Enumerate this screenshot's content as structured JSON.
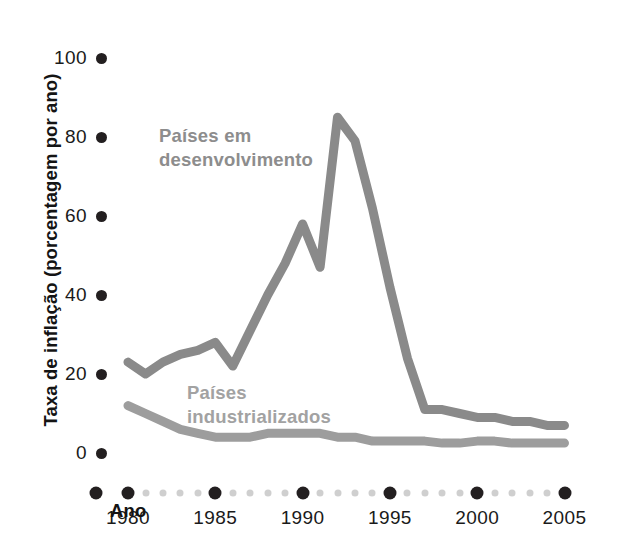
{
  "chart_data": {
    "type": "line",
    "title": "",
    "xlabel": "Ano",
    "ylabel": "Taxa de inflação (porcentagem por ano)",
    "xlim": [
      1979,
      2005
    ],
    "ylim": [
      0,
      100
    ],
    "yticks": [
      0,
      20,
      40,
      60,
      80,
      100
    ],
    "xticks": [
      1980,
      1985,
      1990,
      1995,
      2000,
      2005
    ],
    "xticklabels": [
      "1980",
      "1985",
      "1990",
      "1995",
      "2000",
      "2005"
    ],
    "yticklabels": [
      "0",
      "20",
      "40",
      "60",
      "80",
      "100"
    ],
    "grid": false,
    "legend_position": "inline-annotations",
    "x": [
      1980,
      1981,
      1982,
      1983,
      1984,
      1985,
      1986,
      1987,
      1988,
      1989,
      1990,
      1991,
      1992,
      1993,
      1994,
      1995,
      1996,
      1997,
      1998,
      1999,
      2000,
      2001,
      2002,
      2003,
      2004,
      2005
    ],
    "series": [
      {
        "name": "Países em desenvolvimento",
        "color": "#8a8a8a",
        "values": [
          23,
          20,
          23,
          25,
          26,
          28,
          22,
          31,
          40,
          48,
          58,
          47,
          85,
          79,
          62,
          42,
          24,
          11,
          11,
          10,
          9,
          9,
          8,
          8,
          7,
          7
        ]
      },
      {
        "name": "Países industrializados",
        "color": "#9d9d9d",
        "values": [
          12,
          10,
          8,
          6,
          5,
          4,
          4,
          4,
          5,
          5,
          5,
          5,
          4,
          4,
          3,
          3,
          3,
          3,
          2.5,
          2.5,
          3,
          3,
          2.5,
          2.5,
          2.5,
          2.5
        ]
      }
    ],
    "annotations": [
      {
        "text": "Países em\ndesenvolvimento",
        "color": "#8d8d8d"
      },
      {
        "text": "Países\nindustrializados",
        "color": "#a2a2a2"
      }
    ]
  },
  "axis": {
    "y_title": "Taxa de inflação (porcentagem por ano)",
    "x_title": "Ano",
    "y_tick_labels": [
      "100",
      "80",
      "60",
      "40",
      "20",
      "0"
    ],
    "x_tick_labels": [
      "1980",
      "1985",
      "1990",
      "1995",
      "2000",
      "2005"
    ],
    "tick_dot_color": "#231f20",
    "minor_dot_color": "#cfcfcf"
  },
  "labels": {
    "developing": "Países em\ndesenvolvimento",
    "industrialized": "Países\nindustrializados"
  }
}
